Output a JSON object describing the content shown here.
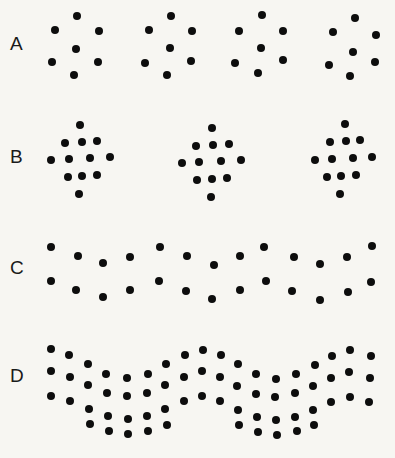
{
  "figure": {
    "background_color": "#f7f6f2",
    "dot_color": "#0d0d0d",
    "label_color": "#1a1a1a",
    "width": 395,
    "height": 458,
    "dot_radius": 4.2
  },
  "rows": [
    {
      "id": "row-a",
      "label": "A",
      "label_x": 10,
      "label_y": 34,
      "description": "four hexagonal seven-dot clusters",
      "cluster_count": 4,
      "dots_per_cluster": 7
    },
    {
      "id": "row-b",
      "label": "B",
      "label_x": 10,
      "label_y": 147,
      "description": "three diamond thirteen-dot clusters",
      "cluster_count": 3,
      "dots_per_cluster": 13
    },
    {
      "id": "row-c",
      "label": "C",
      "label_x": 10,
      "label_y": 258,
      "description": "two wavy horizontal dot lines",
      "cluster_count": 2,
      "dots_per_cluster": 14
    },
    {
      "id": "row-d",
      "label": "D",
      "label_x": 10,
      "label_y": 366,
      "description": "thick wavy dot band with four rows",
      "cluster_count": 1,
      "dots_per_cluster": 60
    }
  ],
  "dots": {
    "row_a": [
      [
        77,
        16
      ],
      [
        55,
        30
      ],
      [
        99,
        31
      ],
      [
        76,
        49
      ],
      [
        52,
        62
      ],
      [
        98,
        62
      ],
      [
        74,
        75
      ],
      [
        171,
        16
      ],
      [
        149,
        30
      ],
      [
        192,
        31
      ],
      [
        170,
        48
      ],
      [
        145,
        63
      ],
      [
        191,
        61
      ],
      [
        167,
        75
      ],
      [
        262,
        15
      ],
      [
        239,
        31
      ],
      [
        283,
        31
      ],
      [
        261,
        48
      ],
      [
        235,
        63
      ],
      [
        283,
        60
      ],
      [
        258,
        73
      ],
      [
        355,
        18
      ],
      [
        333,
        32
      ],
      [
        376,
        35
      ],
      [
        353,
        52
      ],
      [
        329,
        65
      ],
      [
        375,
        62
      ],
      [
        350,
        76
      ]
    ],
    "row_b": [
      [
        80,
        125
      ],
      [
        65,
        143
      ],
      [
        82,
        142
      ],
      [
        97,
        141
      ],
      [
        51,
        160
      ],
      [
        69,
        159
      ],
      [
        90,
        158
      ],
      [
        110,
        157
      ],
      [
        68,
        177
      ],
      [
        82,
        176
      ],
      [
        97,
        175
      ],
      [
        79,
        194
      ],
      [
        212,
        128
      ],
      [
        196,
        146
      ],
      [
        213,
        145
      ],
      [
        229,
        144
      ],
      [
        182,
        163
      ],
      [
        199,
        162
      ],
      [
        221,
        161
      ],
      [
        241,
        160
      ],
      [
        197,
        180
      ],
      [
        212,
        179
      ],
      [
        227,
        178
      ],
      [
        211,
        197
      ],
      [
        345,
        124
      ],
      [
        330,
        142
      ],
      [
        346,
        141
      ],
      [
        360,
        140
      ],
      [
        315,
        160
      ],
      [
        332,
        159
      ],
      [
        353,
        158
      ],
      [
        372,
        157
      ],
      [
        327,
        177
      ],
      [
        341,
        176
      ],
      [
        356,
        175
      ],
      [
        340,
        194
      ]
    ],
    "row_c": [
      [
        51,
        247
      ],
      [
        78,
        256
      ],
      [
        103,
        263
      ],
      [
        130,
        257
      ],
      [
        160,
        247
      ],
      [
        187,
        256
      ],
      [
        214,
        265
      ],
      [
        240,
        256
      ],
      [
        264,
        247
      ],
      [
        294,
        257
      ],
      [
        320,
        264
      ],
      [
        347,
        257
      ],
      [
        372,
        246
      ],
      [
        51,
        281
      ],
      [
        76,
        290
      ],
      [
        103,
        297
      ],
      [
        130,
        290
      ],
      [
        159,
        281
      ],
      [
        186,
        291
      ],
      [
        212,
        299
      ],
      [
        240,
        290
      ],
      [
        266,
        281
      ],
      [
        292,
        291
      ],
      [
        320,
        300
      ],
      [
        348,
        292
      ],
      [
        371,
        282
      ]
    ],
    "row_d": [
      [
        51,
        349
      ],
      [
        69,
        355
      ],
      [
        88,
        364
      ],
      [
        106,
        374
      ],
      [
        127,
        378
      ],
      [
        148,
        374
      ],
      [
        166,
        364
      ],
      [
        185,
        355
      ],
      [
        203,
        350
      ],
      [
        221,
        355
      ],
      [
        238,
        364
      ],
      [
        256,
        374
      ],
      [
        276,
        379
      ],
      [
        296,
        374
      ],
      [
        315,
        365
      ],
      [
        332,
        356
      ],
      [
        350,
        350
      ],
      [
        371,
        356
      ],
      [
        51,
        371
      ],
      [
        70,
        377
      ],
      [
        88,
        385
      ],
      [
        107,
        393
      ],
      [
        127,
        396
      ],
      [
        147,
        393
      ],
      [
        165,
        385
      ],
      [
        184,
        377
      ],
      [
        202,
        371
      ],
      [
        220,
        377
      ],
      [
        237,
        386
      ],
      [
        256,
        394
      ],
      [
        275,
        397
      ],
      [
        295,
        393
      ],
      [
        313,
        386
      ],
      [
        331,
        378
      ],
      [
        349,
        372
      ],
      [
        370,
        378
      ],
      [
        51,
        396
      ],
      [
        70,
        401
      ],
      [
        89,
        409
      ],
      [
        108,
        416
      ],
      [
        128,
        419
      ],
      [
        147,
        416
      ],
      [
        165,
        409
      ],
      [
        184,
        401
      ],
      [
        202,
        396
      ],
      [
        220,
        401
      ],
      [
        238,
        410
      ],
      [
        257,
        417
      ],
      [
        276,
        420
      ],
      [
        295,
        417
      ],
      [
        313,
        410
      ],
      [
        331,
        402
      ],
      [
        350,
        397
      ],
      [
        369,
        402
      ],
      [
        90,
        424
      ],
      [
        109,
        431
      ],
      [
        128,
        434
      ],
      [
        148,
        431
      ],
      [
        167,
        425
      ],
      [
        239,
        425
      ],
      [
        258,
        432
      ],
      [
        277,
        435
      ],
      [
        297,
        431
      ],
      [
        314,
        425
      ]
    ]
  }
}
